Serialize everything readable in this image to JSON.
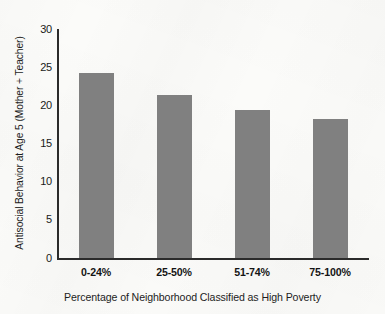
{
  "chart_data": {
    "type": "bar",
    "title": "",
    "categories": [
      "0-24%",
      "25-50%",
      "51-74%",
      "75-100%"
    ],
    "values": [
      24.3,
      21.4,
      19.4,
      18.2
    ],
    "xlabel": "Percentage of Neighborhood Classified as High Poverty",
    "ylabel": "Antisocial Behavior at Age 5 (Mother + Teacher)",
    "ylim": [
      0,
      30
    ],
    "yticks": [
      "0",
      "5",
      "10",
      "15",
      "20",
      "25",
      "30"
    ],
    "ytick_values": [
      0,
      5,
      10,
      15,
      20,
      25,
      30
    ],
    "grid": false,
    "legend": null,
    "bar_color": "#808080",
    "axis_color": "#2b2b2b",
    "background_color": "#fbfbf9"
  }
}
